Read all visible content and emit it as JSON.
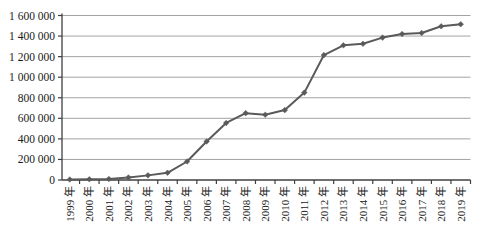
{
  "chart_data": {
    "type": "line",
    "title": "",
    "xlabel": "",
    "ylabel": "",
    "categories": [
      "1999 年",
      "2000 年",
      "2001 年",
      "2002 年",
      "2003 年",
      "2004 年",
      "2005 年",
      "2006 年",
      "2007 年",
      "2008 年",
      "2009 年",
      "2010 年",
      "2011 年",
      "2012 年",
      "2013 年",
      "2014 年",
      "2015 年",
      "2016 年",
      "2017 年",
      "2018 年",
      "2019 年"
    ],
    "series": [
      {
        "name": "series-1",
        "values": [
          5000,
          7000,
          10000,
          25000,
          45000,
          70000,
          180000,
          375000,
          555000,
          650000,
          635000,
          680000,
          850000,
          1215000,
          1310000,
          1325000,
          1385000,
          1420000,
          1430000,
          1495000,
          1515000
        ]
      }
    ],
    "ylim": [
      0,
      1600000
    ],
    "ytick_step": 200000,
    "ytick_labels": [
      "0",
      "200 000",
      "400 000",
      "600 000",
      "800 000",
      "1 000 000",
      "1 200 000",
      "1 400 000",
      "1 600 000"
    ],
    "grid": "horizontal",
    "legend": "none",
    "marker": "diamond",
    "colors": {
      "line": "#5a5a5a",
      "marker": "#5a5a5a",
      "grid": "#8c8c8c",
      "axis": "#404040",
      "text": "#1a1a1a",
      "background": "#ffffff"
    }
  }
}
